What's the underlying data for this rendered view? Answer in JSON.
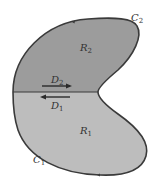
{
  "diagram": {
    "regions": [
      {
        "name": "R",
        "sub": "2",
        "fill": "#9c9c9c"
      },
      {
        "name": "R",
        "sub": "1",
        "fill": "#bdbdbd"
      }
    ],
    "curves": [
      {
        "name": "C",
        "sub": "2"
      },
      {
        "name": "C",
        "sub": "1"
      }
    ],
    "arrows": [
      {
        "name": "D",
        "sub": "2",
        "direction": "right"
      },
      {
        "name": "D",
        "sub": "1",
        "direction": "left"
      }
    ],
    "colors": {
      "outline": "#3a3a3a",
      "upper_fill": "#9c9c9c",
      "lower_fill": "#bdbdbd"
    }
  }
}
